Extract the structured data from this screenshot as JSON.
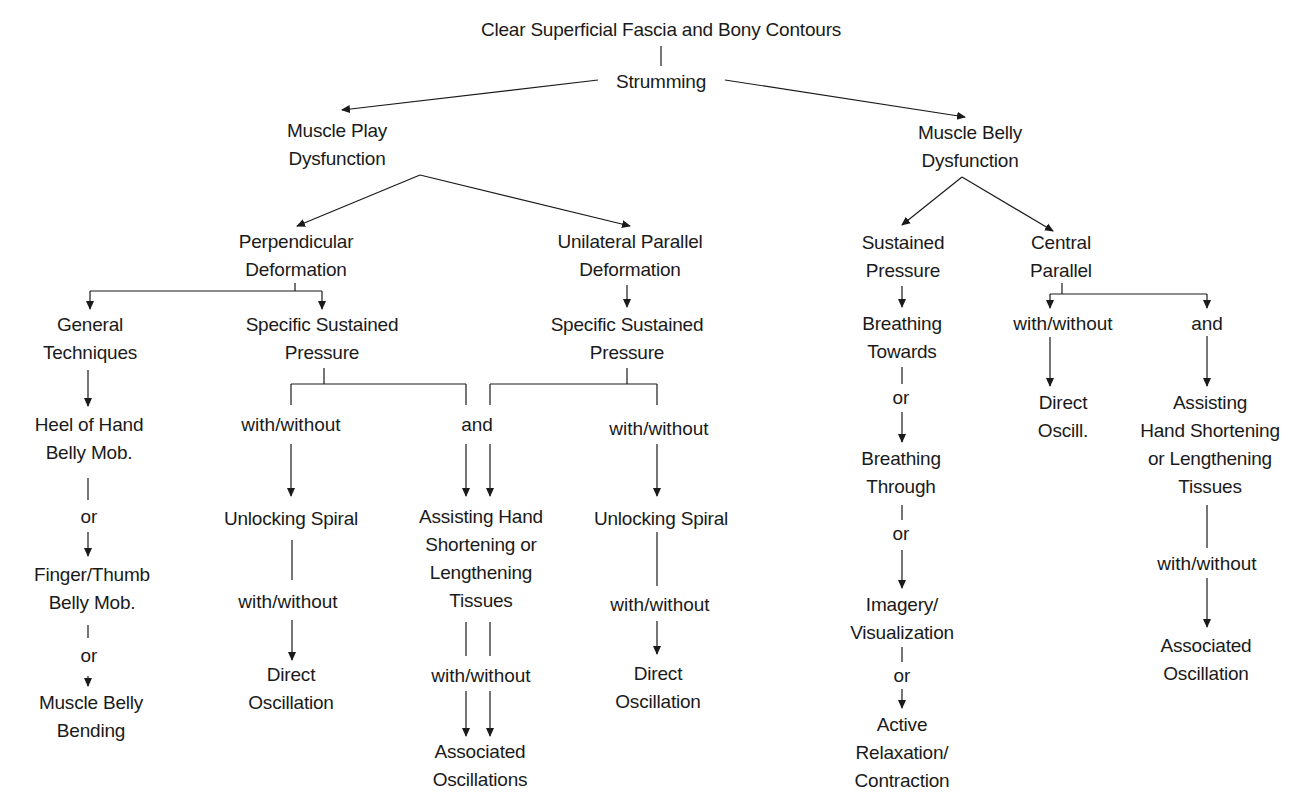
{
  "diagram": {
    "root": {
      "label": "Clear Superficial Fascia and Bony Contours"
    },
    "strumming": {
      "label": "Strumming"
    },
    "muscle_play": {
      "lines": [
        "Muscle Play",
        "Dysfunction"
      ]
    },
    "muscle_belly": {
      "lines": [
        "Muscle Belly",
        "Dysfunction"
      ]
    },
    "perpendicular": {
      "lines": [
        "Perpendicular",
        "Deformation"
      ]
    },
    "unilateral": {
      "lines": [
        "Unilateral Parallel",
        "Deformation"
      ]
    },
    "general_techniques": {
      "lines": [
        "General",
        "Techniques"
      ]
    },
    "ssp_left": {
      "lines": [
        "Specific Sustained",
        "Pressure"
      ]
    },
    "ssp_right": {
      "lines": [
        "Specific Sustained",
        "Pressure"
      ]
    },
    "heel_of_hand": {
      "lines": [
        "Heel of Hand",
        "Belly Mob."
      ]
    },
    "finger_thumb": {
      "lines": [
        "Finger/Thumb",
        "Belly Mob."
      ]
    },
    "muscle_belly_bending": {
      "lines": [
        "Muscle Belly",
        "Bending"
      ]
    },
    "unlocking_left": {
      "label": "Unlocking Spiral"
    },
    "unlocking_right": {
      "label": "Unlocking Spiral"
    },
    "direct_osc_left": {
      "lines": [
        "Direct",
        "Oscillation"
      ]
    },
    "direct_osc_right": {
      "lines": [
        "Direct",
        "Oscillation"
      ]
    },
    "assisting_center": {
      "lines": [
        "Assisting Hand",
        "Shortening or",
        "Lengthening",
        "Tissues"
      ]
    },
    "associated_center": {
      "lines": [
        "Associated",
        "Oscillations"
      ]
    },
    "sustained_pressure": {
      "lines": [
        "Sustained",
        "Pressure"
      ]
    },
    "central_parallel": {
      "lines": [
        "Central",
        "Parallel"
      ]
    },
    "breathing_towards": {
      "lines": [
        "Breathing",
        "Towards"
      ]
    },
    "breathing_through": {
      "lines": [
        "Breathing",
        "Through"
      ]
    },
    "imagery": {
      "lines": [
        "Imagery/",
        "Visualization"
      ]
    },
    "active_relaxation": {
      "lines": [
        "Active",
        "Relaxation/",
        "Contraction"
      ]
    },
    "direct_oscill_short": {
      "lines": [
        "Direct",
        "Oscill."
      ]
    },
    "assisting_right": {
      "lines": [
        "Assisting",
        "Hand Shortening",
        "or Lengthening",
        "Tissues"
      ]
    },
    "associated_right": {
      "lines": [
        "Associated",
        "Oscillation"
      ]
    },
    "conjunctions": {
      "or": "or",
      "and": "and",
      "with_without": "with/without"
    },
    "line_color": "#1a1a1a"
  }
}
